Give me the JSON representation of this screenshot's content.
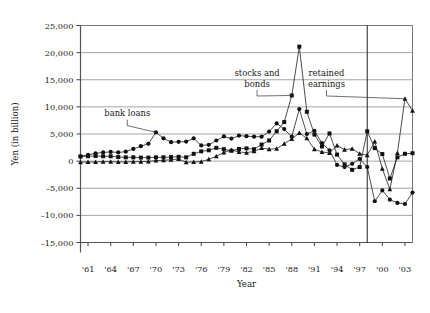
{
  "chart_data": {
    "type": "line",
    "title": "",
    "xlabel": "Year",
    "ylabel": "Yen (in billion)",
    "ylim": [
      -15000,
      25000
    ],
    "ytick_values": [
      25000,
      20000,
      15000,
      10000,
      5000,
      0,
      -5000,
      -10000,
      -15000
    ],
    "ytick_labels": [
      "25,000",
      "20,000",
      "15,000",
      "10,000",
      "5,000",
      "0",
      "–5,000",
      "–10,000",
      "–15,000"
    ],
    "xlim": [
      1960,
      2004
    ],
    "xtick_values": [
      1961,
      1964,
      1967,
      1970,
      1973,
      1976,
      1979,
      1982,
      1985,
      1988,
      1991,
      1994,
      1997,
      2000,
      2003
    ],
    "xtick_labels": [
      "'61",
      "'64",
      "'67",
      "'70",
      "'73",
      "'76",
      "'79",
      "'82",
      "'85",
      "'88",
      "'91",
      "'94",
      "'97",
      "'00",
      "'03"
    ],
    "grid": "horizontal",
    "legend_position": "inline-annotations",
    "vertical_marker_line": {
      "x": 1998,
      "label": ""
    },
    "annotations": [
      {
        "name": "bank-loans-annotation",
        "text": "bank loans",
        "text_x": 1966.2,
        "text_y": 8300,
        "target_x": 1970,
        "target_y": 5300
      },
      {
        "name": "stocks-and-bonds-annotation",
        "text": "stocks and bonds",
        "text_x": 1983.4,
        "text_y": 15600,
        "target_x": 1988,
        "target_y": 12100
      },
      {
        "name": "retained-earnings-annotation",
        "text": "retained earnings",
        "text_x": 1992.6,
        "text_y": 15600,
        "target_x": 2003,
        "target_y": 11500
      }
    ],
    "x": [
      1960,
      1961,
      1962,
      1963,
      1964,
      1965,
      1966,
      1967,
      1968,
      1969,
      1970,
      1971,
      1972,
      1973,
      1974,
      1975,
      1976,
      1977,
      1978,
      1979,
      1980,
      1981,
      1982,
      1983,
      1984,
      1985,
      1986,
      1987,
      1988,
      1989,
      1990,
      1991,
      1992,
      1993,
      1994,
      1995,
      1996,
      1997,
      1998,
      1999,
      2000,
      2001,
      2002,
      2003,
      2004
    ],
    "series": [
      {
        "name": "bank loans",
        "marker": "circle",
        "color": "#111111",
        "values": [
          900,
          1150,
          1450,
          1600,
          1700,
          1600,
          1750,
          2250,
          2750,
          3200,
          5300,
          4200,
          3500,
          3550,
          3600,
          4200,
          2900,
          3000,
          3800,
          4550,
          4150,
          4700,
          4600,
          4500,
          4500,
          5450,
          6950,
          5900,
          4500,
          9600,
          5000,
          5600,
          3300,
          2000,
          -700,
          -1100,
          -500,
          400,
          -1100,
          -7400,
          -5400,
          -7100,
          -7700,
          -7900,
          -5800
        ]
      },
      {
        "name": "stocks and bonds",
        "marker": "square",
        "color": "#111111",
        "values": [
          850,
          900,
          950,
          900,
          900,
          750,
          700,
          700,
          650,
          650,
          700,
          700,
          750,
          800,
          700,
          1350,
          1800,
          2000,
          2450,
          2200,
          1900,
          2250,
          2350,
          2200,
          3050,
          3800,
          5500,
          7200,
          12100,
          21100,
          9100,
          4900,
          2700,
          5100,
          1200,
          -600,
          -1600,
          -1100,
          5500,
          2400,
          1300,
          -3200,
          700,
          1350,
          1450
        ]
      },
      {
        "name": "retained earnings",
        "marker": "triangle",
        "color": "#111111",
        "values": [
          -200,
          -150,
          -150,
          -100,
          -100,
          -150,
          -150,
          -100,
          -100,
          -50,
          100,
          150,
          250,
          400,
          -200,
          -150,
          -100,
          350,
          900,
          1600,
          2050,
          1700,
          1550,
          1800,
          2400,
          2200,
          2300,
          3200,
          4100,
          5200,
          4200,
          2200,
          1700,
          1500,
          2900,
          2100,
          2300,
          1350,
          1100,
          3600,
          -1400,
          -5200,
          1500,
          11500,
          9300
        ]
      }
    ]
  }
}
